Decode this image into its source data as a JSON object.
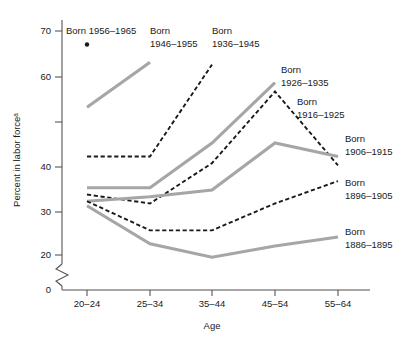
{
  "chart_data": {
    "type": "line",
    "title": "",
    "xlabel": "Age",
    "ylabel": "Percent in labor forceᵃ",
    "categories": [
      "20–24",
      "25–34",
      "35–44",
      "45–54",
      "55–64"
    ],
    "ylim": [
      0,
      72
    ],
    "yticks": [
      0,
      20,
      30,
      40,
      50,
      60,
      70
    ],
    "ytick_labels": [
      "0",
      "20",
      "30",
      "40",
      "",
      "60",
      "70"
    ],
    "axis_break": true,
    "axis_break_note": "broken y-axis between 0 and 20",
    "grid": false,
    "legend_position": "inline-annotations",
    "series": [
      {
        "name": "Born 1956–1965",
        "style": "marker",
        "color": "#1a1a1a",
        "x": [
          "20–24"
        ],
        "values": [
          67
        ]
      },
      {
        "name": "Born 1946–1955",
        "style": "solid-gray",
        "color": "#a6a6a6",
        "x": [
          "20–24",
          "25–34"
        ],
        "values": [
          53,
          63
        ]
      },
      {
        "name": "Born 1936–1945",
        "style": "dashed-black",
        "color": "#1a1a1a",
        "x": [
          "20–24",
          "25–34",
          "35–44"
        ],
        "values": [
          42,
          42,
          62.5
        ]
      },
      {
        "name": "Born 1926–1935",
        "style": "solid-gray",
        "color": "#a6a6a6",
        "x": [
          "20–24",
          "25–34",
          "35–44",
          "45–54"
        ],
        "values": [
          35,
          35,
          45,
          58.5
        ]
      },
      {
        "name": "Born 1916–1925",
        "style": "dashed-black",
        "color": "#1a1a1a",
        "x": [
          "20–24",
          "25–34",
          "35–44",
          "45–54",
          "55–64"
        ],
        "values": [
          33.5,
          31.5,
          40.5,
          56.5,
          40
        ]
      },
      {
        "name": "Born 1906–1915",
        "style": "solid-gray",
        "color": "#a6a6a6",
        "x": [
          "20–24",
          "25–34",
          "35–44",
          "45–54",
          "55–64"
        ],
        "values": [
          32,
          33,
          34.5,
          45,
          42
        ]
      },
      {
        "name": "Born 1896–1905",
        "style": "dashed-black",
        "color": "#1a1a1a",
        "x": [
          "20–24",
          "25–34",
          "35–44",
          "45–54",
          "55–64"
        ],
        "values": [
          32,
          25.5,
          25.5,
          31.5,
          36.5
        ]
      },
      {
        "name": "Born 1886–1895",
        "style": "solid-gray",
        "color": "#a6a6a6",
        "x": [
          "20–24",
          "25–34",
          "35–44",
          "45–54",
          "55–64"
        ],
        "values": [
          31,
          22.5,
          19.5,
          22,
          24
        ]
      }
    ],
    "annotations": [
      {
        "id": "lab1956",
        "lines": [
          "Born 1956–1965"
        ]
      },
      {
        "id": "lab1946",
        "lines": [
          "Born",
          "1946–1955"
        ]
      },
      {
        "id": "lab1936",
        "lines": [
          "Born",
          "1936–1945"
        ]
      },
      {
        "id": "lab1926",
        "lines": [
          "Born",
          "1926–1935"
        ]
      },
      {
        "id": "lab1916",
        "lines": [
          "Born",
          "1916–1925"
        ]
      },
      {
        "id": "lab1906",
        "lines": [
          "Born",
          "1906–1915"
        ]
      },
      {
        "id": "lab1896",
        "lines": [
          "Born",
          "1896–1905"
        ]
      },
      {
        "id": "lab1886",
        "lines": [
          "Born",
          "1886–1895"
        ]
      }
    ]
  },
  "axes": {
    "y_label": "Percent in labor forceᵃ",
    "x_label": "Age",
    "y_tick_70": "70",
    "y_tick_60": "60",
    "y_tick_40": "40",
    "y_tick_30": "30",
    "y_tick_20": "20",
    "y_tick_0": "0",
    "x_tick_1": "20–24",
    "x_tick_2": "25–34",
    "x_tick_3": "35–44",
    "x_tick_4": "45–54",
    "x_tick_5": "55–64"
  },
  "labels": {
    "l1956_a": "Born 1956–1965",
    "l1946_a": "Born",
    "l1946_b": "1946–1955",
    "l1936_a": "Born",
    "l1936_b": "1936–1945",
    "l1926_a": "Born",
    "l1926_b": "1926–1935",
    "l1916_a": "Born",
    "l1916_b": "1916–1925",
    "l1906_a": "Born",
    "l1906_b": "1906–1915",
    "l1896_a": "Born",
    "l1896_b": "1896–1905",
    "l1886_a": "Born",
    "l1886_b": "1886–1895"
  },
  "colors": {
    "gray_series": "#a6a6a6",
    "black_series": "#1a1a1a",
    "axis": "#555555",
    "background": "#ffffff"
  }
}
